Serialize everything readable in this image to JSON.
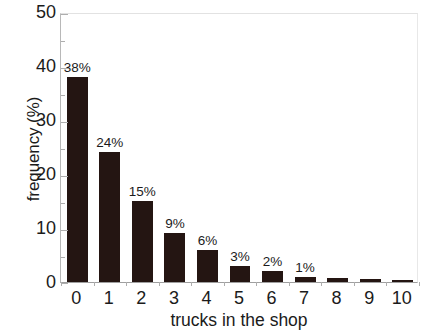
{
  "chart_data": {
    "type": "bar",
    "title": "",
    "subtitle": "",
    "xlabel": "trucks in the shop",
    "ylabel": "frequency (%)",
    "categories": [
      "0",
      "1",
      "2",
      "3",
      "4",
      "5",
      "6",
      "7",
      "8",
      "9",
      "10"
    ],
    "values": [
      38,
      24,
      15,
      9,
      6,
      3,
      2,
      1,
      0.7,
      0.5,
      0.4
    ],
    "data_labels": [
      "38%",
      "24%",
      "15%",
      "9%",
      "6%",
      "3%",
      "2%",
      "1%",
      "",
      "",
      ""
    ],
    "ylim": [
      0,
      50
    ],
    "ytick_labels": [
      "0",
      "10",
      "20",
      "30",
      "40",
      "50"
    ],
    "ytick_values": [
      0,
      10,
      20,
      30,
      40,
      50
    ],
    "yminor_values": [
      5,
      15,
      25,
      35,
      45
    ],
    "grid": false,
    "legend": false,
    "legend_position": "none",
    "bar_color": "#241512",
    "axis_color": "#aeaeae",
    "text_color": "#1b1b1b"
  },
  "axes": {
    "y_title": "frequency (%)",
    "x_title": "trucks in the shop"
  }
}
